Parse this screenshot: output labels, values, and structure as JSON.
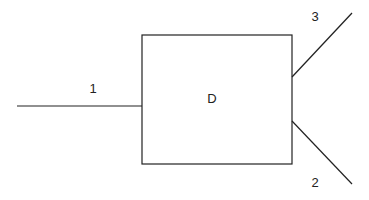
{
  "diagram": {
    "unit": {
      "label": "D",
      "box": {
        "x": 142,
        "y": 35,
        "w": 150,
        "h": 129
      }
    },
    "streams": [
      {
        "id": "1",
        "label": "1",
        "from": [
          17,
          106
        ],
        "to": [
          142,
          106
        ],
        "label_pos": [
          93,
          93
        ]
      },
      {
        "id": "3",
        "label": "3",
        "from": [
          292,
          77
        ],
        "to": [
          352,
          13
        ],
        "label_pos": [
          315,
          21
        ]
      },
      {
        "id": "2",
        "label": "2",
        "from": [
          292,
          121
        ],
        "to": [
          352,
          184
        ],
        "label_pos": [
          315,
          187
        ]
      }
    ],
    "line_color": "#222222"
  }
}
